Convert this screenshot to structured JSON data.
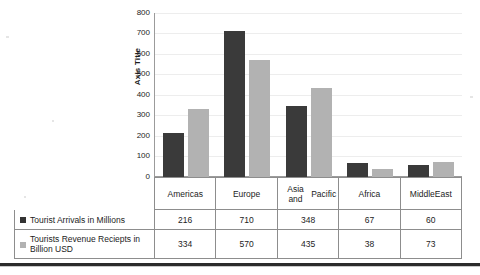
{
  "chart_data": {
    "type": "bar",
    "title": "",
    "xlabel": "",
    "ylabel": "Axis Title",
    "ylim": [
      0,
      800
    ],
    "yticks": [
      800,
      700,
      600,
      500,
      400,
      300,
      200,
      100,
      0
    ],
    "grid": true,
    "legend_position": "table-below",
    "categories": [
      "Americas",
      "Europe",
      "Asia and Pacific",
      "Africa",
      "Middle East"
    ],
    "series": [
      {
        "name": "Tourist Arrivals in Millions",
        "color": "#3a3a3a",
        "values": [
          216,
          710,
          348,
          67,
          60
        ]
      },
      {
        "name": "Tourists Revenue Reciepts in Billion USD",
        "color": "#b2b2b2",
        "values": [
          334,
          570,
          435,
          38,
          73
        ]
      }
    ]
  },
  "axis": {
    "title": "Axis Title",
    "tick_800": "800",
    "tick_700": "700",
    "tick_600": "600",
    "tick_500": "500",
    "tick_400": "400",
    "tick_300": "300",
    "tick_200": "200",
    "tick_100": "100",
    "tick_0": "0"
  },
  "categories": [
    {
      "label": "Americas"
    },
    {
      "label": "Europe"
    },
    {
      "label": "Asia and\nPacific"
    },
    {
      "label": "Africa"
    },
    {
      "label": "Middle\nEast"
    }
  ],
  "table": {
    "rows": [
      {
        "legend": "Tourist Arrivals in Millions",
        "swatch": "dark-square-icon",
        "values": [
          "216",
          "710",
          "348",
          "67",
          "60"
        ]
      },
      {
        "legend": "Tourists Revenue Reciepts in Billion USD",
        "swatch": "light-square-icon",
        "values": [
          "334",
          "570",
          "435",
          "38",
          "73"
        ]
      }
    ]
  }
}
